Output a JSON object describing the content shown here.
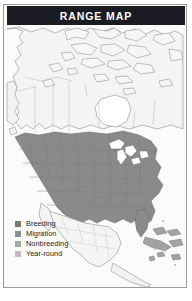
{
  "card": {
    "title": "RANGE MAP",
    "title_bg": "#1b1b24",
    "title_color": "#ffffff",
    "border_color": "#9a9a9a",
    "background": "#ffffff"
  },
  "map": {
    "name": "north-america-range-map",
    "background": "#fbfbfb",
    "land_fill": "#f4f4f4",
    "outline_color": "#8d8d8d",
    "internal_border_color": "#b4b4b4",
    "water_fill": "#ffffff",
    "regions": [
      {
        "name": "canada",
        "shading": "none"
      },
      {
        "name": "arctic-islands",
        "shading": "none"
      },
      {
        "name": "alaska-panhandle",
        "shading": "none"
      },
      {
        "name": "united-states",
        "shading": "breeding"
      },
      {
        "name": "great-lakes",
        "shading": "water"
      },
      {
        "name": "florida",
        "shading": "breeding"
      },
      {
        "name": "mexico",
        "shading": "none"
      },
      {
        "name": "baja-california",
        "shading": "none"
      },
      {
        "name": "cuba",
        "shading": "nonbreeding"
      },
      {
        "name": "hispaniola",
        "shading": "nonbreeding"
      },
      {
        "name": "bahamas",
        "shading": "nonbreeding"
      },
      {
        "name": "central-america",
        "shading": "none"
      }
    ]
  },
  "legend": {
    "items": [
      {
        "label": "Breeding",
        "color": "#7a7a7a"
      },
      {
        "label": "Migration",
        "color": "#8e8e8e"
      },
      {
        "label": "Nonbreeding",
        "color": "#a8a8a8"
      },
      {
        "label": "Year-round",
        "color": "#bdbdbd"
      }
    ]
  }
}
